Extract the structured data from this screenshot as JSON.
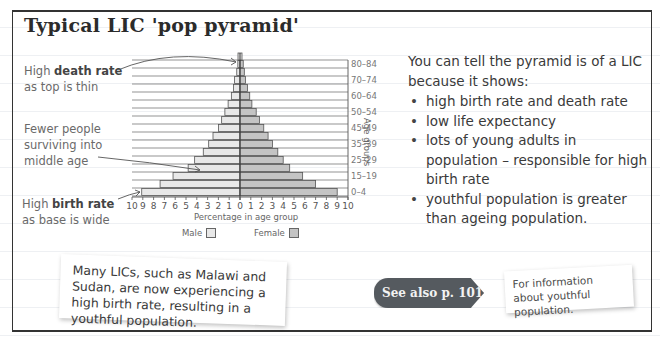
{
  "title": "Typical LIC 'pop pyramid'",
  "annotations": {
    "death_rate": {
      "prefix": "High ",
      "bold": "death rate",
      "line2": "as top is thin"
    },
    "middle_age": {
      "line1": "Fewer people",
      "line2": "surviving into",
      "line3": "middle age"
    },
    "birth_rate": {
      "prefix": "High ",
      "bold": "birth rate",
      "line2": "as base is wide"
    }
  },
  "explanation": {
    "intro": "You can tell the pyramid is of a LIC because it shows:",
    "bullets": [
      "high birth rate and death rate",
      "low life expectancy",
      "lots of young adults in population – responsible for high birth rate",
      "youthful population is greater than ageing population."
    ]
  },
  "callout": {
    "text": "Many LICs, such as Malawi and Sudan, are now experiencing a high birth rate, resulting in a youthful population."
  },
  "see_also": {
    "label": "See also p. 101",
    "info": "For information about youthful population."
  },
  "colors": {
    "male_bar": "#e8e8e8",
    "female_bar": "#c4c4c4",
    "bar_stroke": "#555555",
    "see_also_bg": "#555a5f"
  },
  "chart_data": {
    "type": "bar",
    "orientation": "horizontal-pyramid",
    "title": "Typical LIC 'pop pyramid'",
    "xlabel": "Percentage in age group",
    "ylabel": "Age groups",
    "x_ticks_left": [
      "10",
      "9",
      "8",
      "7",
      "6",
      "5",
      "4",
      "3",
      "2",
      "1",
      "0"
    ],
    "x_ticks_right": [
      "1",
      "2",
      "3",
      "4",
      "5",
      "6",
      "7",
      "8",
      "9",
      "10"
    ],
    "xlim": [
      -10,
      10
    ],
    "y_tick_labels": [
      "0-4",
      "15-19",
      "25-29",
      "35-39",
      "45-49",
      "50-54",
      "60-64",
      "70-74",
      "80-84"
    ],
    "categories": [
      "0-4",
      "5-9",
      "10-14",
      "15-19",
      "20-24",
      "25-29",
      "30-34",
      "35-39",
      "40-44",
      "45-49",
      "50-54",
      "55-59",
      "60-64",
      "65-69",
      "70-74",
      "75-79",
      "80-84"
    ],
    "series": [
      {
        "name": "Male",
        "side": "left",
        "values": [
          9.1,
          7.4,
          6.2,
          4.8,
          4.2,
          3.4,
          2.9,
          2.5,
          2.0,
          1.7,
          1.4,
          1.1,
          0.8,
          0.6,
          0.5,
          0.3,
          0.2
        ]
      },
      {
        "name": "Female",
        "side": "right",
        "values": [
          9.0,
          7.0,
          5.8,
          4.6,
          4.0,
          3.5,
          3.0,
          2.6,
          2.2,
          1.8,
          1.5,
          1.1,
          0.9,
          0.7,
          0.5,
          0.4,
          0.3
        ]
      }
    ],
    "legend": [
      "Male",
      "Female"
    ],
    "legend_position": "bottom",
    "grid": "horizontal"
  }
}
